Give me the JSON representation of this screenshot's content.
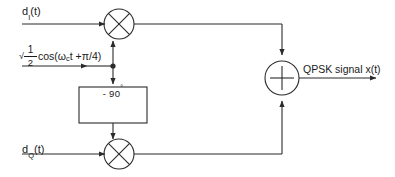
{
  "diagram": {
    "type": "block-diagram",
    "background": "#ffffff",
    "line_color": "#2b2b2b",
    "text_color": "#1a1a1a",
    "inputs": {
      "in_phase_label": "d",
      "in_phase_sub": "I",
      "in_phase_suffix": "(t)",
      "quadrature_label": "d",
      "quadrature_sub": "Q",
      "quadrature_suffix": "(t)"
    },
    "carrier": {
      "numerator": "1",
      "denominator": "2",
      "radical": "√",
      "function": "cos(",
      "omega": "ω",
      "omega_sub": "c",
      "time_plus": "t + ",
      "pi_over_4": "π/4)"
    },
    "phase_shifter": {
      "label": "- 90",
      "degree": "°"
    },
    "summer": {
      "symbol": "+"
    },
    "multipliers": {
      "symbol": "×",
      "count": 2
    },
    "output": {
      "label": "QPSK signal x(t)"
    }
  }
}
